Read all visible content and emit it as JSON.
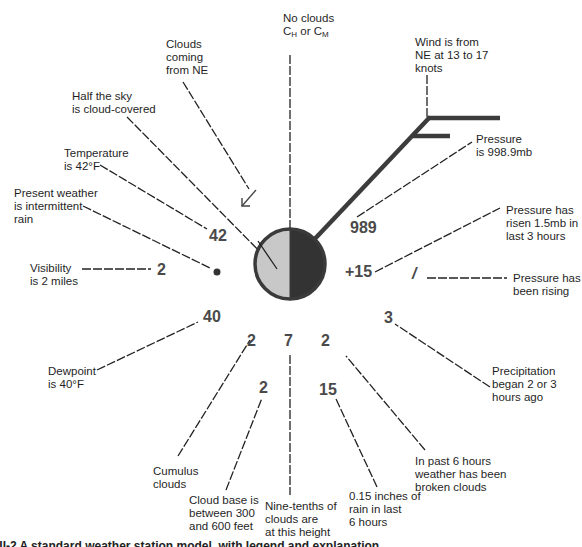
{
  "diagram": {
    "type": "weather-station-model",
    "station_circle": {
      "cloud_cover": "half",
      "left_fill": "#c8c8c8",
      "right_fill": "#333333",
      "border": "#3a3a3a"
    },
    "values": {
      "temperature": "42",
      "visibility": "2",
      "dewpoint": "40",
      "pressure": "989",
      "pressure_change": "+15",
      "pressure_tendency": "/",
      "precip_time": "3",
      "low_cloud_type": "2",
      "cloud_base_height": "2",
      "cloud_amount": "7",
      "past_weather": "2",
      "rainfall": "15",
      "present_weather_symbol": "•",
      "cloud_direction_symbol": "↙"
    },
    "labels": {
      "no_clouds_line1": "No clouds",
      "no_clouds_line2_c1": "C",
      "no_clouds_line2_sub1": "H",
      "no_clouds_line2_mid": " or C",
      "no_clouds_line2_sub2": "M",
      "clouds_coming": [
        "Clouds",
        "coming",
        "from NE"
      ],
      "half_sky": [
        "Half the sky",
        "is cloud-covered"
      ],
      "temperature": [
        "Temperature",
        "is 42°F"
      ],
      "present_weather": [
        "Present weather",
        "is intermittent",
        "rain"
      ],
      "visibility": [
        "Visibility",
        "is 2 miles"
      ],
      "dewpoint": [
        "Dewpoint",
        "is 40°F"
      ],
      "cumulus": [
        "Cumulus",
        "clouds"
      ],
      "cloud_base": [
        "Cloud base is",
        "between 300",
        "and 600 feet"
      ],
      "nine_tenths": [
        "Nine-tenths of",
        "clouds are",
        "at this height"
      ],
      "rain_inches": [
        "0.15 inches of",
        "rain in last",
        "6 hours"
      ],
      "past_6_hours": [
        "In past 6 hours",
        "weather has been",
        "broken clouds"
      ],
      "precipitation": [
        "Precipitation",
        "began 2 or 3",
        "hours ago"
      ],
      "pressure_rising": [
        "Pressure has",
        "been rising"
      ],
      "pressure_risen": [
        "Pressure has",
        "risen 1.5mb in",
        "last 3 hours"
      ],
      "pressure": [
        "Pressure",
        "is 998.9mb"
      ],
      "wind": [
        "Wind is from",
        "NE at 13 to 17",
        "knots"
      ]
    },
    "caption": "III-2   A standard weather station model, with legend and explanation"
  }
}
